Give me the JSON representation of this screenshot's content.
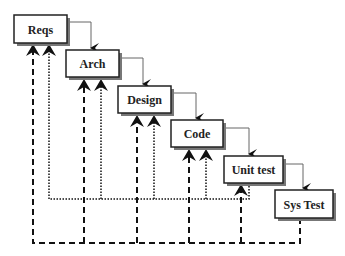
{
  "diagram": {
    "type": "waterfall-v-model",
    "stages": [
      {
        "id": "reqs",
        "label": "Reqs"
      },
      {
        "id": "arch",
        "label": "Arch"
      },
      {
        "id": "design",
        "label": "Design"
      },
      {
        "id": "code",
        "label": "Code"
      },
      {
        "id": "unit-test",
        "label": "Unit test"
      },
      {
        "id": "sys-test",
        "label": "Sys Test"
      }
    ],
    "flow": "each stage flows to the next via solid arrow",
    "feedback": {
      "dotted": "Unit test feeds back to Reqs, Arch, Design, Code",
      "dashed": "Sys Test feeds back to Reqs, Arch, Design, Code, Unit test"
    }
  }
}
